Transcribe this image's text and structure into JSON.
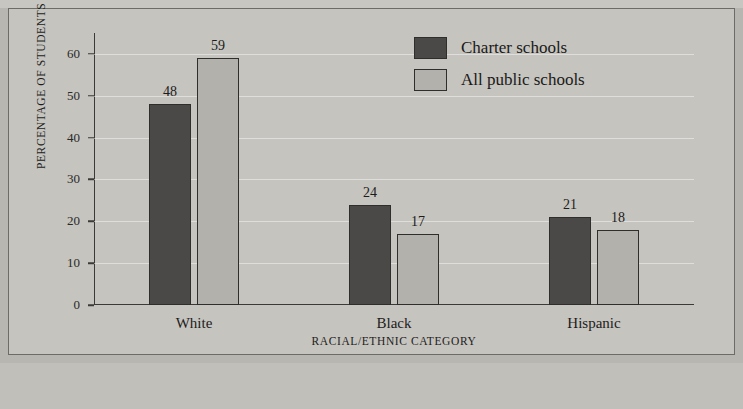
{
  "chart_data": {
    "type": "bar",
    "title": "",
    "xlabel": "RACIAL/ETHNIC CATEGORY",
    "ylabel": "PERCENTAGE OF STUDENTS",
    "categories": [
      "White",
      "Black",
      "Hispanic"
    ],
    "series": [
      {
        "name": "Charter schools",
        "values": [
          48,
          24,
          21
        ],
        "color": "#4a4947"
      },
      {
        "name": "All public schools",
        "values": [
          59,
          17,
          18
        ],
        "color": "#b3b1ac"
      }
    ],
    "ylim": [
      0,
      65
    ],
    "yticks": [
      0,
      10,
      20,
      30,
      40,
      50,
      60
    ],
    "grid": true,
    "legend_position": "top-right"
  }
}
